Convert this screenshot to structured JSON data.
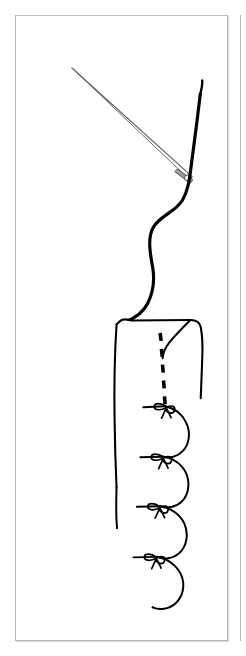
{
  "page": {
    "background_color": "#ffffff",
    "width": 246,
    "height": 656
  },
  "figure": {
    "title": "Needle and thread gathering a fabric tube into tied segments",
    "panel_border_color": "#b9b9b9",
    "panel_background": "#ffffff",
    "ink_color": "#000000",
    "needle_color": "#6e6e6e",
    "thread_color": "#000000",
    "segment_count": 9,
    "tie_count": 9,
    "has_dashed_basting_line": true,
    "dashed_stitch_count": 5
  },
  "caption": {
    "text": ""
  }
}
